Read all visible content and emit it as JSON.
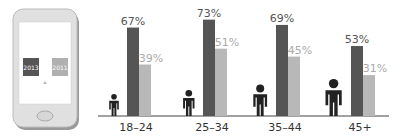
{
  "colors": {
    "series_2013": "#555555",
    "series_2011": "#b8b8b8",
    "label_2013": "#555555",
    "label_2011": "#aaaaaa",
    "axis": "#444444",
    "figure": "#222222"
  },
  "phone": {
    "legend": [
      {
        "label": "2013",
        "color": "#555555"
      },
      {
        "label": "2011",
        "color": "#aaaaaa"
      }
    ]
  },
  "chart_data": {
    "type": "bar",
    "title": "",
    "xlabel": "",
    "ylabel": "",
    "categories": [
      "18–24",
      "25–34",
      "35–44",
      "45+"
    ],
    "series": [
      {
        "name": "2013",
        "values": [
          67,
          73,
          69,
          53
        ]
      },
      {
        "name": "2011",
        "values": [
          39,
          51,
          45,
          31
        ]
      }
    ],
    "value_labels": {
      "2013": [
        "67%",
        "73%",
        "69%",
        "53%"
      ],
      "2011": [
        "39%",
        "51%",
        "45%",
        "31%"
      ]
    },
    "ylim": [
      0,
      100
    ],
    "grid": false,
    "legend_position": "left (phone illustration)"
  }
}
